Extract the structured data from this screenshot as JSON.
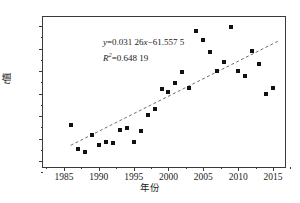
{
  "chart_data": {
    "type": "scatter",
    "title": "",
    "xlabel": "年份",
    "ylabel": "t值",
    "xlim": [
      1982,
      2017
    ],
    "ylim": [
      0.33,
      1.68
    ],
    "xticks": [
      1985,
      1990,
      1995,
      2000,
      2005,
      2010,
      2015
    ],
    "yticks": [
      0.4,
      0.6,
      0.8,
      1.0,
      1.2,
      1.4,
      1.6
    ],
    "ytick_labels": [
      "0.4",
      "0.6",
      "0.8",
      "1.0",
      "1.2",
      "1.4",
      "1.6"
    ],
    "xtick_labels": [
      "1985",
      "1990",
      "1995",
      "2000",
      "2005",
      "2010",
      "2015"
    ],
    "grid": false,
    "legend": null,
    "marker": "square",
    "marker_color": "#111111",
    "series": [
      {
        "name": "t值",
        "x": [
          1986,
          1987,
          1988,
          1989,
          1990,
          1991,
          1992,
          1993,
          1994,
          1995,
          1996,
          1997,
          1998,
          1999,
          2000,
          2001,
          2002,
          2003,
          2004,
          2005,
          2006,
          2007,
          2008,
          2009,
          2010,
          2011,
          2012,
          2013,
          2014,
          2015
        ],
        "y": [
          0.72,
          0.51,
          0.48,
          0.63,
          0.54,
          0.57,
          0.56,
          0.68,
          0.69,
          0.57,
          0.67,
          0.81,
          0.86,
          1.04,
          1.01,
          1.09,
          1.19,
          1.05,
          1.56,
          1.48,
          1.37,
          1.2,
          1.28,
          1.59,
          1.2,
          1.16,
          1.38,
          1.26,
          1.0,
          1.05
        ]
      }
    ],
    "trendline": {
      "type": "linear",
      "slope": 0.03126,
      "intercept": -61.5575,
      "style": "dashed",
      "color": "#6b6b6b",
      "x_start": 1986,
      "x_end": 2016
    },
    "annotations": {
      "equation_var_y": "y",
      "equation_body": "=0.031 26",
      "equation_var_x": "x",
      "equation_tail": "−61.557 5",
      "r_squared_var": "R",
      "r_squared_sup": "2",
      "r_squared_value": "=0.648 19"
    }
  }
}
